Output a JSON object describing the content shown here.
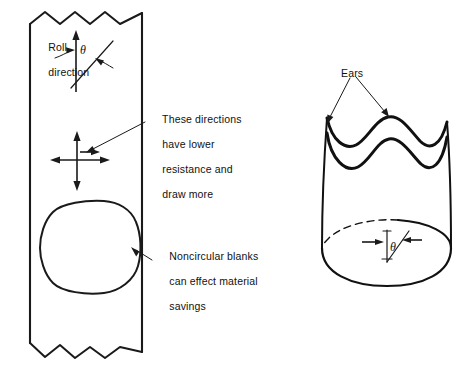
{
  "figure": {
    "background_color": "#ffffff",
    "line_color": "#1a1a1a"
  },
  "left_diagram": {
    "name": "sheet-metal-strip",
    "roll_direction_label": "Roll\ndirection",
    "roll_direction_line1": "Roll",
    "roll_direction_line2": "direction",
    "angle_symbol": "θ",
    "directions_note": "These directions\nhave lower\nresistance and\ndraw more",
    "directions_note_line1": "These directions",
    "directions_note_line2": "have lower",
    "directions_note_line3": "resistance and",
    "directions_note_line4": "draw more",
    "blank_note": "Noncircular blanks\ncan effect material\nsavings",
    "blank_note_line1": "Noncircular blanks",
    "blank_note_line2": "can effect material",
    "blank_note_line3": "savings"
  },
  "right_diagram": {
    "name": "drawn-cup-with-ears",
    "ears_label": "Ears",
    "angle_symbol": "θ"
  }
}
